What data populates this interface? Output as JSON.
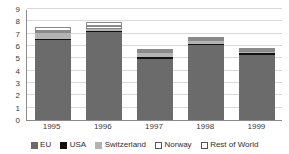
{
  "chart_data": {
    "type": "bar",
    "subtype": "stacked-column",
    "title": "",
    "xlabel": "",
    "ylabel": "",
    "categories": [
      "1995",
      "1996",
      "1997",
      "1998",
      "1999"
    ],
    "ylim": [
      0,
      9
    ],
    "yticks": [
      0,
      1,
      2,
      3,
      4,
      5,
      6,
      7,
      8,
      9
    ],
    "ytick_labels": [
      "0",
      "1",
      "2",
      "3",
      "4",
      "5",
      "6",
      "7",
      "8",
      "9"
    ],
    "grid": true,
    "grid_axis": "y",
    "legend_position": "bottom",
    "series": [
      {
        "name": "EU",
        "color": "#6b6b6b",
        "values": [
          6.5,
          7.1,
          4.95,
          6.1,
          5.25
        ]
      },
      {
        "name": "USA",
        "color": "#111111",
        "values": [
          0.05,
          0.05,
          0.15,
          0.1,
          0.15
        ]
      },
      {
        "name": "Switzerland",
        "color": "#b3b3b3",
        "values": [
          0.5,
          0.15,
          0.3,
          0.2,
          0.1
        ]
      },
      {
        "name": "Norway",
        "color": "#ffffff",
        "values": [
          0.1,
          0.3,
          0.1,
          0.1,
          0.05
        ]
      },
      {
        "name": "Rest of World",
        "color": "#ffffff",
        "values": [
          0.25,
          0.3,
          0.2,
          0.2,
          0.1
        ]
      }
    ],
    "totals": [
      7.4,
      7.9,
      5.7,
      6.7,
      5.65
    ]
  },
  "legend": {
    "items": [
      {
        "label": "EU"
      },
      {
        "label": "USA"
      },
      {
        "label": "Switzerland"
      },
      {
        "label": "Norway"
      },
      {
        "label": "Rest of World"
      }
    ]
  }
}
